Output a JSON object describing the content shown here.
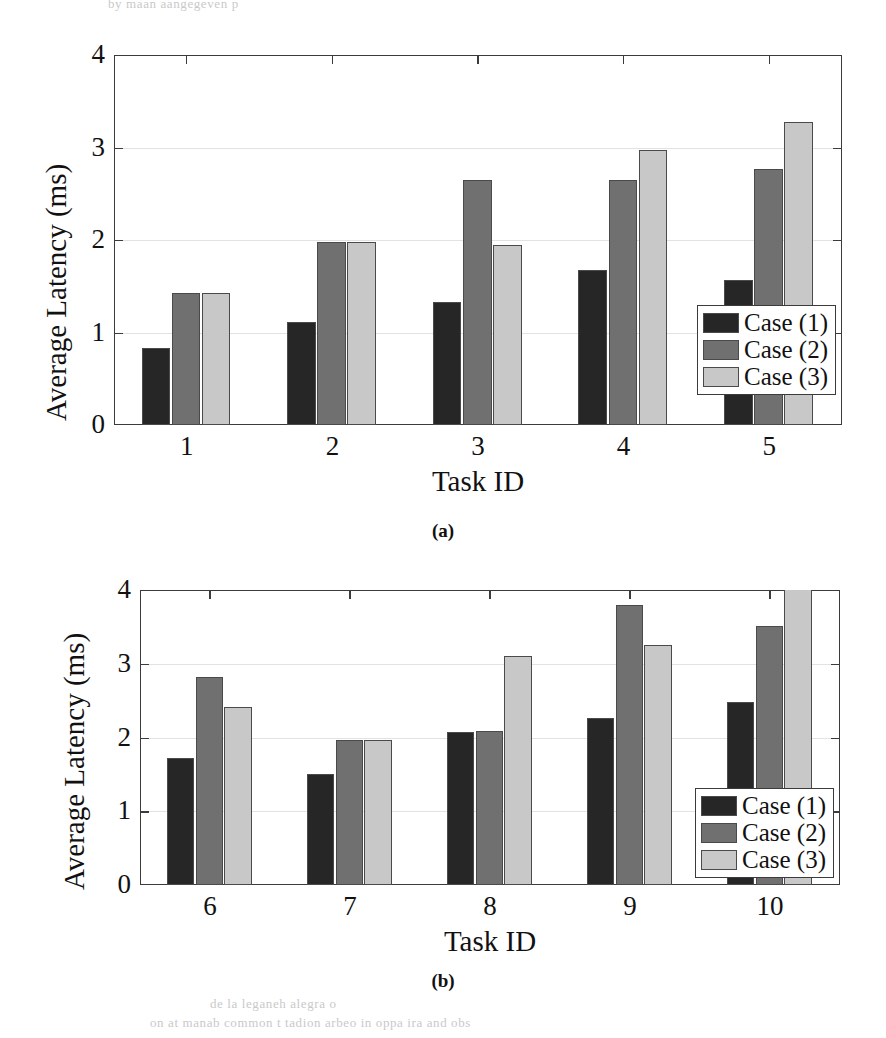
{
  "bleed_text": {
    "top": "by maan aangegeven p",
    "bottom1": "de la  leganeh alegra o",
    "bottom2": "on  at  manab  common   t  tadion arbeo   in  oppa   ira  and   obs"
  },
  "colors": {
    "case1": "#262626",
    "case2": "#707070",
    "case3": "#c8c8c8",
    "axis": "#3b3b3b",
    "grid": "#e2e2e2",
    "background": "#ffffff"
  },
  "legend": {
    "items": [
      {
        "label": "Case (1)",
        "color": "#262626"
      },
      {
        "label": "Case (2)",
        "color": "#707070"
      },
      {
        "label": "Case (3)",
        "color": "#c8c8c8"
      }
    ]
  },
  "captions": {
    "a": "(a)",
    "b": "(b)"
  },
  "chart_data": [
    {
      "id": "chart-a",
      "type": "bar",
      "title": "",
      "xlabel": "Task ID",
      "ylabel": "Average Latency (ms)",
      "categories": [
        "1",
        "2",
        "3",
        "4",
        "5"
      ],
      "ylim": [
        0,
        4
      ],
      "yticks": [
        0,
        1,
        2,
        3,
        4
      ],
      "ytick_labels": [
        "0",
        "1",
        "2",
        "3",
        "4"
      ],
      "grid": true,
      "legend_position": "lower right",
      "series": [
        {
          "name": "Case (1)",
          "color": "#262626",
          "values": [
            0.83,
            1.11,
            1.33,
            1.68,
            1.57
          ]
        },
        {
          "name": "Case (2)",
          "color": "#707070",
          "values": [
            1.43,
            1.98,
            2.65,
            2.65,
            2.77
          ]
        },
        {
          "name": "Case (3)",
          "color": "#c8c8c8",
          "values": [
            1.43,
            1.98,
            1.95,
            2.97,
            3.28
          ]
        }
      ]
    },
    {
      "id": "chart-b",
      "type": "bar",
      "title": "",
      "xlabel": "Task ID",
      "ylabel": "Average Latency (ms)",
      "categories": [
        "6",
        "7",
        "8",
        "9",
        "10"
      ],
      "ylim": [
        0,
        4
      ],
      "yticks": [
        0,
        1,
        2,
        3,
        4
      ],
      "ytick_labels": [
        "0",
        "1",
        "2",
        "3",
        "4"
      ],
      "grid": true,
      "legend_position": "lower right",
      "series": [
        {
          "name": "Case (1)",
          "color": "#262626",
          "values": [
            1.72,
            1.5,
            2.08,
            2.26,
            2.48
          ]
        },
        {
          "name": "Case (2)",
          "color": "#707070",
          "values": [
            2.82,
            1.97,
            2.09,
            3.8,
            3.51
          ]
        },
        {
          "name": "Case (3)",
          "color": "#c8c8c8",
          "values": [
            2.41,
            1.97,
            3.11,
            3.25,
            4.05
          ]
        }
      ]
    }
  ]
}
